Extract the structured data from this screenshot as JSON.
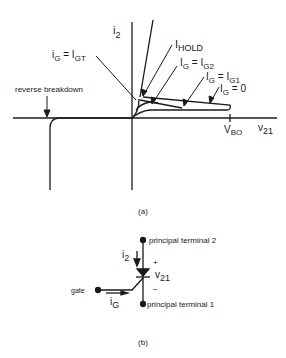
{
  "figure_a": {
    "y_axis_label_main": "i",
    "y_axis_label_sub": "2",
    "x_axis_label_main": "v",
    "x_axis_label_sub": "21",
    "vbo_main": "V",
    "vbo_sub": "BO",
    "hold_main": "I",
    "hold_sub": "HOLD",
    "igt_label": {
      "main1": "i",
      "sub1": "G",
      "eq": " = I",
      "sub2": "GT"
    },
    "ig2_label": {
      "main1": "I",
      "sub1": "G",
      "eq": " = I",
      "sub2": "G2"
    },
    "ig1_label": {
      "main1": "I",
      "sub1": "G",
      "eq": " = I",
      "sub2": "G1"
    },
    "ig0_label": {
      "main1": "I",
      "sub1": "G",
      "eq": " = 0"
    },
    "reverse_breakdown": "reverse breakdown",
    "caption": "(a)"
  },
  "figure_b": {
    "terminal2": "principal terminal 2",
    "terminal1": "principal terminal 1",
    "gate": "gate",
    "i2_main": "i",
    "i2_sub": "2",
    "v21_main": "v",
    "v21_sub": "21",
    "plus": "+",
    "minus": "−",
    "ig_main": "i",
    "ig_sub": "G",
    "caption": "(b)"
  },
  "colors": {
    "ink": "#1a1a1a",
    "background": "#ffffff"
  }
}
